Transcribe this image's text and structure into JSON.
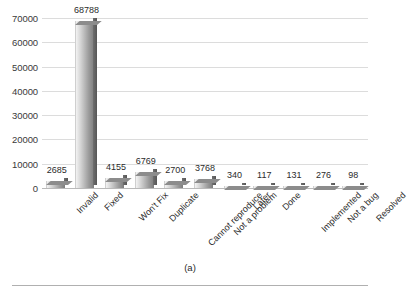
{
  "figure": {
    "caption": "(a)"
  },
  "chart_data": {
    "type": "bar",
    "title": "",
    "xlabel": "",
    "ylabel": "",
    "categories": [
      "Invalid",
      "Fixed",
      "Won't Fix",
      "Duplicate",
      "Cannot reproduce",
      "Not a problem",
      "Later",
      "Done",
      "Implemented",
      "Not a bug",
      "Resolved"
    ],
    "values": [
      2685,
      68788,
      4155,
      6769,
      2700,
      3768,
      340,
      117,
      131,
      276,
      98
    ],
    "value_labels": [
      "2685",
      "68788",
      "4155",
      "6769",
      "2700",
      "3768",
      "340",
      "117",
      "131",
      "276",
      "98"
    ],
    "ylim": [
      0,
      70000
    ],
    "ytick_labels": [
      "0",
      "10000",
      "20000",
      "30000",
      "40000",
      "50000",
      "60000",
      "70000"
    ],
    "ytick_values": [
      0,
      10000,
      20000,
      30000,
      40000,
      50000,
      60000,
      70000
    ],
    "grid": true,
    "legend": null,
    "bar_style": "3d-gray-gradient",
    "colors": {
      "bar_front_light": "#f3f3f3",
      "bar_front_dark": "#7d7d7d",
      "bar_side": "#565656",
      "bar_top": "#8c8c8c",
      "gridline": "#dcdcdc",
      "axis": "#b9b9b9",
      "text": "#2b2b2b",
      "background": "#ffffff"
    }
  }
}
